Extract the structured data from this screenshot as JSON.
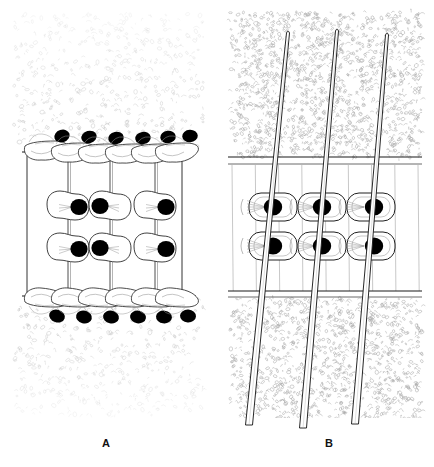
{
  "figure": {
    "background_color": "#ffffff",
    "ink_color": "#000000",
    "stipple_color": "#b9b9b9",
    "nucleus_color": "#000000"
  },
  "panels": [
    {
      "id": "A",
      "label": "A",
      "label_x": 107,
      "label_y": 444,
      "description": "Transverse section showing upper and lower epidermal cell layers with prominent dark nuclei, enclosing two tiers of palisade/mesophyll cells strung on vertical strands.",
      "bounds": {
        "x": 8,
        "y": 8,
        "width": 200,
        "height": 410
      },
      "texture": {
        "region": "outer",
        "name": "fine-stipple",
        "density": "sparse",
        "color": "#c4c4c4"
      },
      "cuticle_lines": [
        {
          "name": "upper-cuticle",
          "y": 152,
          "x1": 22,
          "x2": 196
        },
        {
          "name": "lower-cuticle",
          "y": 296,
          "x1": 22,
          "x2": 196
        }
      ],
      "side_walls": [
        {
          "name": "left-wall",
          "x": 27,
          "y1": 152,
          "y2": 296
        },
        {
          "name": "right-wall",
          "x": 182,
          "y1": 152,
          "y2": 296
        }
      ],
      "epidermis_rows": [
        {
          "name": "upper-epidermis",
          "orientation": "above-cuticle",
          "cell_count": 6,
          "cells": [
            {
              "cx": 45,
              "cy": 148,
              "nucleus_cx": 62,
              "nucleus_cy": 136
            },
            {
              "cx": 72,
              "cy": 150,
              "nucleus_cx": 89,
              "nucleus_cy": 137
            },
            {
              "cx": 99,
              "cy": 151,
              "nucleus_cx": 116,
              "nucleus_cy": 138
            },
            {
              "cx": 126,
              "cy": 151,
              "nucleus_cx": 143,
              "nucleus_cy": 138
            },
            {
              "cx": 152,
              "cy": 151,
              "nucleus_cx": 168,
              "nucleus_cy": 137
            },
            {
              "cx": 176,
              "cy": 150,
              "nucleus_cx": 190,
              "nucleus_cy": 136
            }
          ]
        },
        {
          "name": "lower-epidermis",
          "orientation": "below-cuticle",
          "cell_count": 6,
          "cells": [
            {
              "cx": 45,
              "cy": 300,
              "nucleus_cx": 57,
              "nucleus_cy": 316
            },
            {
              "cx": 72,
              "cy": 300,
              "nucleus_cx": 84,
              "nucleus_cy": 317
            },
            {
              "cx": 99,
              "cy": 300,
              "nucleus_cx": 111,
              "nucleus_cy": 317
            },
            {
              "cx": 126,
              "cy": 300,
              "nucleus_cx": 138,
              "nucleus_cy": 317
            },
            {
              "cx": 152,
              "cy": 300,
              "nucleus_cx": 164,
              "nucleus_cy": 317
            },
            {
              "cx": 176,
              "cy": 300,
              "nucleus_cx": 188,
              "nucleus_cy": 316
            }
          ]
        }
      ],
      "strands": [
        {
          "name": "strand-left",
          "x_top": 68,
          "x_bottom": 68
        },
        {
          "name": "strand-mid",
          "x_top": 110,
          "x_bottom": 110
        },
        {
          "name": "strand-right",
          "x_top": 155,
          "x_bottom": 155
        }
      ],
      "mesophyll_rows": [
        {
          "name": "mesophyll-upper-row",
          "cell_count": 3,
          "cells": [
            {
              "cx": 68,
              "cy": 208,
              "nucleus_cx": 79,
              "nucleus_cy": 207
            },
            {
              "cx": 110,
              "cy": 208,
              "nucleus_cx": 100,
              "nucleus_cy": 206
            },
            {
              "cx": 155,
              "cy": 208,
              "nucleus_cx": 166,
              "nucleus_cy": 207
            }
          ]
        },
        {
          "name": "mesophyll-lower-row",
          "cell_count": 3,
          "cells": [
            {
              "cx": 68,
              "cy": 250,
              "nucleus_cx": 79,
              "nucleus_cy": 249
            },
            {
              "cx": 110,
              "cy": 250,
              "nucleus_cx": 100,
              "nucleus_cy": 248
            },
            {
              "cx": 155,
              "cy": 250,
              "nucleus_cx": 166,
              "nucleus_cy": 249
            }
          ]
        }
      ]
    },
    {
      "id": "B",
      "label": "B",
      "label_x": 330,
      "label_y": 444,
      "description": "Transverse section showing three long tapering fibers (trichomes) piercing the cuticle layers obliquely, with two tiers of rounded cells bearing dark nuclei between the cuticles.",
      "bounds": {
        "x": 224,
        "y": 8,
        "width": 202,
        "height": 410
      },
      "texture": {
        "region": "outer",
        "name": "dense-squiggle-stipple",
        "density": "dense",
        "color": "#a8a8a8"
      },
      "cuticle_lines": [
        {
          "name": "upper-cuticle-outer",
          "y": 157,
          "x1": 228,
          "x2": 422
        },
        {
          "name": "upper-cuticle-inner",
          "y": 164,
          "x1": 228,
          "x2": 422
        },
        {
          "name": "lower-cuticle-outer",
          "y": 291,
          "x1": 228,
          "x2": 422
        },
        {
          "name": "lower-cuticle-inner",
          "y": 297,
          "x1": 228,
          "x2": 422
        }
      ],
      "vertical_strand_count": 8,
      "fibers": [
        {
          "name": "fiber-left",
          "tip_x": 288,
          "tip_y": 33,
          "base_x": 249,
          "base_y": 425,
          "width_top": 3,
          "width_bottom": 7
        },
        {
          "name": "fiber-mid",
          "tip_x": 337,
          "tip_y": 31,
          "base_x": 303,
          "base_y": 428,
          "width_top": 3,
          "width_bottom": 7
        },
        {
          "name": "fiber-right",
          "tip_x": 387,
          "tip_y": 35,
          "base_x": 355,
          "base_y": 424,
          "width_top": 3,
          "width_bottom": 7
        }
      ],
      "cell_rows": [
        {
          "name": "cell-upper-row",
          "cell_count": 3,
          "cells": [
            {
              "cx": 273,
              "cy": 207,
              "nucleus_cx": 273,
              "nucleus_cy": 207
            },
            {
              "cx": 322,
              "cy": 207,
              "nucleus_cx": 322,
              "nucleus_cy": 207
            },
            {
              "cx": 371,
              "cy": 207,
              "nucleus_cx": 374,
              "nucleus_cy": 207
            }
          ]
        },
        {
          "name": "cell-lower-row",
          "cell_count": 3,
          "cells": [
            {
              "cx": 273,
              "cy": 246,
              "nucleus_cx": 273,
              "nucleus_cy": 246
            },
            {
              "cx": 322,
              "cy": 246,
              "nucleus_cx": 322,
              "nucleus_cy": 246
            },
            {
              "cx": 371,
              "cy": 246,
              "nucleus_cx": 374,
              "nucleus_cy": 246
            }
          ]
        }
      ]
    }
  ]
}
